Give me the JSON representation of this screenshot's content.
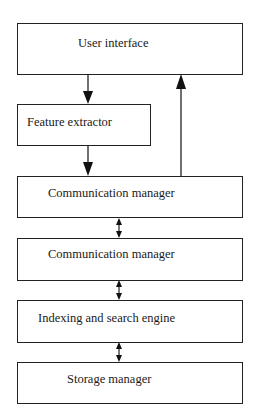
{
  "diagram": {
    "type": "block-architecture",
    "boxes": [
      {
        "id": "user-interface",
        "label": "User interface"
      },
      {
        "id": "feature-extractor",
        "label": "Feature extractor"
      },
      {
        "id": "communication-manager-1",
        "label": "Communication manager"
      },
      {
        "id": "communication-manager-2",
        "label": "Communication manager"
      },
      {
        "id": "indexing-search-engine",
        "label": "Indexing and search engine"
      },
      {
        "id": "storage-manager",
        "label": "Storage manager"
      }
    ],
    "edges": [
      {
        "from": "user-interface",
        "to": "feature-extractor",
        "direction": "one-way"
      },
      {
        "from": "feature-extractor",
        "to": "communication-manager-1",
        "direction": "one-way"
      },
      {
        "from": "communication-manager-1",
        "to": "user-interface",
        "direction": "one-way"
      },
      {
        "from": "communication-manager-1",
        "to": "communication-manager-2",
        "direction": "two-way"
      },
      {
        "from": "communication-manager-2",
        "to": "indexing-search-engine",
        "direction": "two-way"
      },
      {
        "from": "indexing-search-engine",
        "to": "storage-manager",
        "direction": "two-way"
      }
    ]
  }
}
